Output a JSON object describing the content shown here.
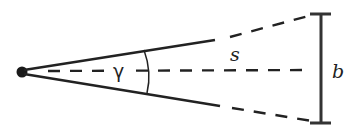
{
  "diagram": {
    "labels": {
      "angle": "γ",
      "distance": "s",
      "size": "b"
    },
    "colors": {
      "stroke": "#222222",
      "bar": "#333333",
      "background": "#ffffff"
    }
  }
}
